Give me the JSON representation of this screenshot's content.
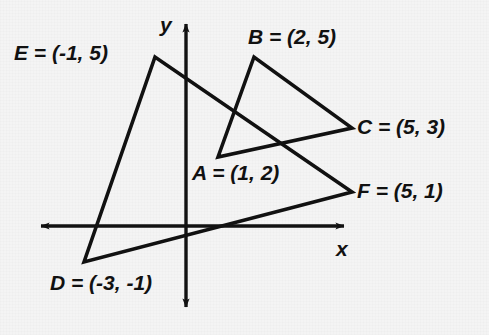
{
  "figure": {
    "background_color": "#f4f4f4",
    "stroke_color": "#111111"
  },
  "axes": {
    "x_label": "x",
    "y_label": "y",
    "x_axis": {
      "y": 226,
      "x_start": 37,
      "x_end": 348,
      "arrows": "both"
    },
    "y_axis": {
      "x": 186,
      "y_start": 20,
      "y_end": 311,
      "arrows": "both"
    },
    "origin_px": {
      "x": 186,
      "y": 226
    }
  },
  "labels": {
    "A": {
      "point": "A",
      "eq": " = ",
      "coord": "(1, 2)",
      "text": "A = (1, 2)"
    },
    "B": {
      "point": "B",
      "eq": " = ",
      "coord": "(2, 5)",
      "text": "B = (2, 5)"
    },
    "C": {
      "point": "C",
      "eq": " = ",
      "coord": "(5, 3)",
      "text": "C = (5, 3)"
    },
    "D": {
      "point": "D",
      "eq": " = ",
      "coord": "(-3, -1)",
      "text": "D = (-3, -1)"
    },
    "E": {
      "point": "E",
      "eq": " = ",
      "coord": "(-1, 5)",
      "text": "E = (-1, 5)"
    },
    "F": {
      "point": "F",
      "eq": " = ",
      "coord": "(5, 1)",
      "text": "F = (5, 1)"
    }
  },
  "chart_data": {
    "type": "scatter",
    "title": "",
    "xlabel": "x",
    "ylabel": "y",
    "grid": false,
    "legend": null,
    "xlim": [
      -4.5,
      5.9
    ],
    "ylim": [
      -2.6,
      6.3
    ],
    "shapes": [
      {
        "name": "triangle-ABC",
        "closed": true,
        "vertices": [
          {
            "label": "A",
            "x": 1,
            "y": 2,
            "px": 218,
            "py": 157
          },
          {
            "label": "B",
            "x": 2,
            "y": 5,
            "px": 254,
            "py": 57
          },
          {
            "label": "C",
            "x": 5,
            "y": 3,
            "px": 352,
            "py": 128
          }
        ]
      },
      {
        "name": "triangle-DEF",
        "closed": true,
        "vertices": [
          {
            "label": "D",
            "x": -3,
            "y": -1,
            "px": 84,
            "py": 262
          },
          {
            "label": "E",
            "x": -1,
            "y": 5,
            "px": 155,
            "py": 57
          },
          {
            "label": "F",
            "x": 5,
            "y": 1,
            "px": 352,
            "py": 192
          }
        ]
      }
    ]
  }
}
